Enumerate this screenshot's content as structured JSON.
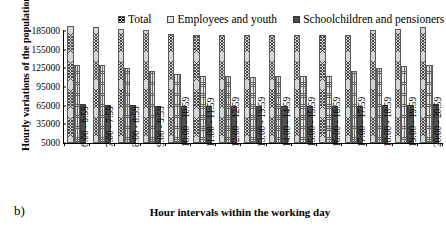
{
  "panel_label": "b)",
  "chart_data": {
    "type": "bar",
    "title": "",
    "xlabel": "Hour intervals within the working day",
    "ylabel": "Hourly variations of the population",
    "ylim": [
      5000,
      185000
    ],
    "yticks": [
      5000,
      35000,
      65000,
      95000,
      125000,
      155000,
      185000
    ],
    "ytick_labels": [
      "5000",
      "35000",
      "65000",
      "95000",
      "125000",
      "155000",
      "185000"
    ],
    "grid": false,
    "legend_position": "top",
    "categories": [
      "6:00 - 6:59",
      "7:00 - 7:59",
      "8:00 - 8:59",
      "9:00 - 9:59",
      "10:00 - 10:59",
      "11:00 - 11:59",
      "12:00 - 12:59",
      "13:00 - 13:59",
      "14:00 - 14:59",
      "15:00 - 15:59",
      "16:00 - 16:59",
      "17:00 - 17:59",
      "18:00 - 18:59",
      "19:00 - 19:59",
      "20:00 - 20:59"
    ],
    "series": [
      {
        "name": "Total",
        "color": "#d5d5d5",
        "pattern": "cross-hatch",
        "values": [
          193000,
          192000,
          189000,
          186000,
          181000,
          179000,
          179000,
          178000,
          178000,
          178000,
          179000,
          179000,
          186000,
          189000,
          192000
        ]
      },
      {
        "name": "Employees and youth",
        "color": "#e6e6e6",
        "pattern": "grid-hatch",
        "values": [
          131000,
          131000,
          126000,
          121000,
          116000,
          112000,
          112000,
          111000,
          112000,
          112000,
          112000,
          120000,
          126000,
          129000,
          131000
        ]
      },
      {
        "name": "Schoolchildren and pensioners",
        "color": "#4f4f4f",
        "pattern": "solid",
        "values": [
          68000,
          66000,
          66000,
          65000,
          65000,
          65000,
          65000,
          65000,
          65000,
          65000,
          65000,
          65000,
          66000,
          66000,
          68000
        ]
      }
    ]
  }
}
